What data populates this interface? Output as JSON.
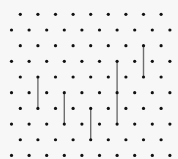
{
  "board": {
    "width": 178,
    "height": 159,
    "background": "#f7f7f7",
    "dot_color": "#111111",
    "dot_radius": 1.6,
    "line_color": "#6e6e6e",
    "line_width": 1.4,
    "grid": {
      "rows": 10,
      "origin_y": 14.3,
      "row_spacing": 15.68,
      "col_spacing": 17.6,
      "even_row_start_x": 20.3,
      "even_row_count": 9,
      "odd_row_start_x": 11.5,
      "odd_row_count": 10
    },
    "lines": [
      {
        "col": 1,
        "row_start": 4,
        "row_end": 6
      },
      {
        "col": 3,
        "row_start": 5,
        "row_end": 7
      },
      {
        "col": 4,
        "row_start": 6,
        "row_end": 8
      },
      {
        "col": 6,
        "row_start": 3,
        "row_end": 7
      },
      {
        "col": 7,
        "row_start": 2,
        "row_end": 4
      }
    ]
  }
}
